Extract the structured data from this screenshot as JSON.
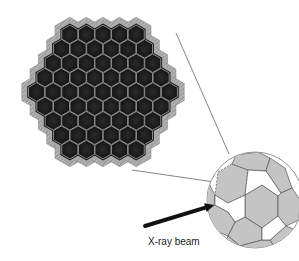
{
  "diagram": {
    "type": "detector-array-with-crystal-ball",
    "array": {
      "shape": "hexagonal",
      "row_counts": [
        5,
        6,
        7,
        8,
        9,
        8,
        7,
        6,
        5
      ],
      "center": [
        103,
        92
      ],
      "cell_pitch_x": 16.6,
      "cell_pitch_y": 14.4,
      "cell_fill": "#1b1b1b",
      "cell_border": "#8a8a8a",
      "frame_fill": "#9a9a9a"
    },
    "zoom_sphere": {
      "center": [
        255,
        200
      ],
      "radius": 48,
      "panel_fill": "#c4c4c4",
      "line_color": "#555555"
    },
    "connector_lines": [
      {
        "from": [
          176,
          33
        ],
        "to": [
          229,
          154
        ]
      },
      {
        "from": [
          132,
          170
        ],
        "to": [
          214,
          182
        ]
      }
    ],
    "beam": {
      "from": [
        145,
        226
      ],
      "to": [
        214,
        205
      ],
      "label": "X-ray beam",
      "label_pos": [
        148,
        236
      ]
    }
  }
}
